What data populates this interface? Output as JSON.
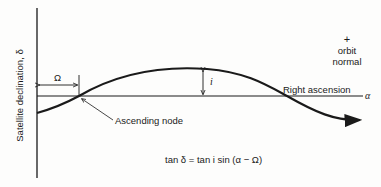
{
  "diagram": {
    "y_axis_label": "Satellite declination, δ",
    "x_axis_symbol": "α",
    "horizontal_line_label": "Right ascension",
    "omega_label": "Ω",
    "inclination_label": "i",
    "node_label": "Ascending node",
    "orbit_normal": {
      "symbol": "+",
      "line1": "orbit",
      "line2": "normal"
    },
    "formula": "tan δ = tan i sin (α − Ω)"
  }
}
